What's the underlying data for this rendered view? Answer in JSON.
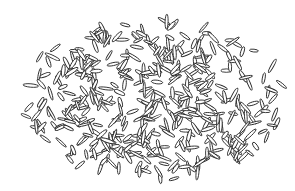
{
  "image": {
    "subject": "line drawing of scattered rice grains",
    "background_color": "#ffffff",
    "stroke_color": "#2a2a2a",
    "cluster": {
      "cx": 152,
      "cy": 100,
      "rx": 134,
      "ry": 80
    },
    "grain": {
      "length_min": 9,
      "length_max": 16,
      "width_min": 2.2,
      "width_max": 3.6
    },
    "grain_count": 420,
    "seed": 7
  }
}
